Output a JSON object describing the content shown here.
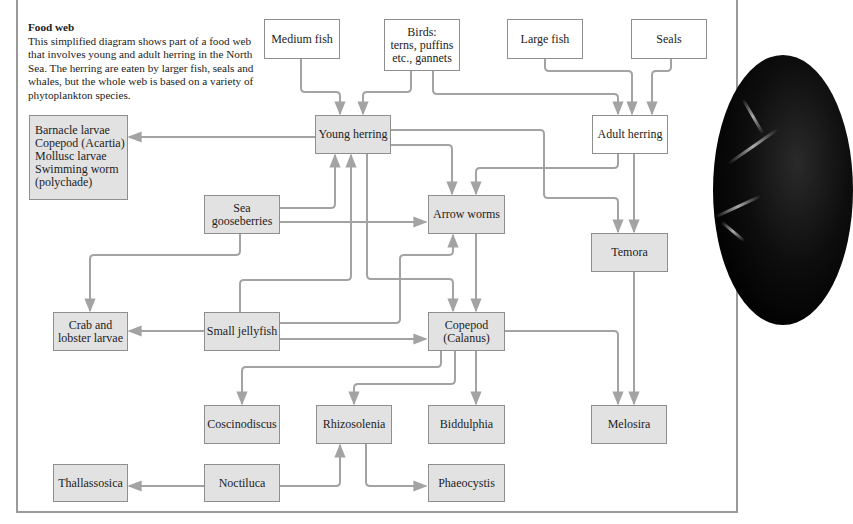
{
  "intro": {
    "title": "Food web",
    "text": "This simplified diagram shows part of a food web that involves young and adult herring in the North Sea. The herring are eaten by larger fish, seals and whales, but the whole web is based on a variety of phytoplankton species."
  },
  "nodes": {
    "medium_fish": "Medium fish",
    "birds": "Birds:\nterns, puffins\netc., gannets",
    "large_fish": "Large fish",
    "seals": "Seals",
    "young_herring": "Young herring",
    "adult_herring": "Adult herring",
    "barnacle_group": "Barnacle larvae\nCopepod (Acartia)\nMollusc larvae\nSwimming worm\n(polychade)",
    "sea_gooseberries": "Sea\ngooseberries",
    "arrow_worms": "Arrow worms",
    "temora": "Temora",
    "crab_lobster": "Crab and\nlobster larvae",
    "small_jellyfish": "Small jellyfish",
    "copepod_calanus": "Copepod\n(Calanus)",
    "coscinodiscus": "Coscinodiscus",
    "rhizosolenia": "Rhizosolenia",
    "biddulphia": "Biddulphia",
    "melosira": "Melosira",
    "thallassosica": "Thallassosica",
    "noctiluca": "Noctiluca",
    "phaeocystis": "Phaeocystis"
  },
  "edges": [
    {
      "from": "Medium fish",
      "to": "Young herring"
    },
    {
      "from": "Birds",
      "to": "Young herring"
    },
    {
      "from": "Birds",
      "to": "Adult herring"
    },
    {
      "from": "Large fish",
      "to": "Adult herring"
    },
    {
      "from": "Seals",
      "to": "Adult herring"
    },
    {
      "from": "Young herring",
      "to": "Barnacle larvae group"
    },
    {
      "from": "Young herring",
      "to": "Arrow worms"
    },
    {
      "from": "Young herring",
      "to": "Temora"
    },
    {
      "from": "Young herring",
      "to": "Copepod (Calanus)"
    },
    {
      "from": "Sea gooseberries",
      "to": "Young herring"
    },
    {
      "from": "Small jellyfish",
      "to": "Young herring"
    },
    {
      "from": "Adult herring",
      "to": "Arrow worms"
    },
    {
      "from": "Adult herring",
      "to": "Temora"
    },
    {
      "from": "Sea gooseberries",
      "to": "Arrow worms"
    },
    {
      "from": "Sea gooseberries",
      "to": "Crab and lobster larvae"
    },
    {
      "from": "Small jellyfish",
      "to": "Crab and lobster larvae"
    },
    {
      "from": "Small jellyfish",
      "to": "Arrow worms"
    },
    {
      "from": "Small jellyfish",
      "to": "Copepod (Calanus)"
    },
    {
      "from": "Arrow worms",
      "to": "Copepod (Calanus)"
    },
    {
      "from": "Temora",
      "to": "Melosira"
    },
    {
      "from": "Copepod (Calanus)",
      "to": "Melosira"
    },
    {
      "from": "Copepod (Calanus)",
      "to": "Coscinodiscus"
    },
    {
      "from": "Copepod (Calanus)",
      "to": "Rhizosolenia"
    },
    {
      "from": "Copepod (Calanus)",
      "to": "Biddulphia"
    },
    {
      "from": "Noctiluca",
      "to": "Thallassosica"
    },
    {
      "from": "Noctiluca",
      "to": "Rhizosolenia"
    },
    {
      "from": "Rhizosolenia",
      "to": "Phaeocystis"
    }
  ],
  "colors": {
    "box_fill": "#e2e2e2",
    "box_border": "#8e8e8e",
    "arrow": "#a3a3a3",
    "frame": "#9a9a9a"
  }
}
